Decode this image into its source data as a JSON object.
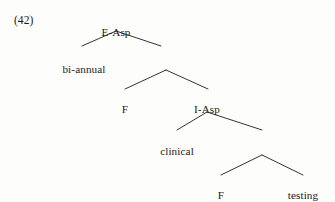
{
  "figure": {
    "example_number": "(42)",
    "type": "syntactic-tree",
    "background_color": "#fdfdfb",
    "line_color": "#1c1c1c",
    "text_color": "#1c1c1c"
  },
  "nodes": [
    {
      "id": "e-asp",
      "label": "E-Asp",
      "x": 116,
      "y": 27,
      "kind": "nonterminal"
    },
    {
      "id": "bi-annual",
      "label": "bi-annual",
      "x": 84,
      "y": 64,
      "kind": "terminal"
    },
    {
      "id": "f1",
      "label": "F",
      "x": 125,
      "y": 104,
      "kind": "nonterminal"
    },
    {
      "id": "i-asp",
      "label": "I-Asp",
      "x": 207,
      "y": 104,
      "kind": "nonterminal"
    },
    {
      "id": "clinical",
      "label": "clinical",
      "x": 177,
      "y": 146,
      "kind": "terminal"
    },
    {
      "id": "f2",
      "label": "F",
      "x": 221,
      "y": 190,
      "kind": "nonterminal"
    },
    {
      "id": "testing",
      "label": "testing",
      "x": 303,
      "y": 190,
      "kind": "terminal"
    }
  ],
  "branches": [
    {
      "id": "branch-easp-left",
      "from": [
        116,
        31
      ],
      "to": [
        82,
        46
      ],
      "parent": "e-asp",
      "child": "bi-annual"
    },
    {
      "id": "branch-easp-right",
      "from": [
        116,
        31
      ],
      "to": [
        161,
        46
      ],
      "parent": "e-asp",
      "child": "fp1"
    },
    {
      "id": "branch-fp1-left",
      "from": [
        166,
        70
      ],
      "to": [
        125,
        89
      ],
      "parent": "fp1",
      "child": "f1"
    },
    {
      "id": "branch-fp1-right",
      "from": [
        166,
        70
      ],
      "to": [
        208,
        89
      ],
      "parent": "fp1",
      "child": "i-asp"
    },
    {
      "id": "branch-iasp-left",
      "from": [
        207,
        112
      ],
      "to": [
        177,
        130
      ],
      "parent": "i-asp",
      "child": "clinical"
    },
    {
      "id": "branch-iasp-right",
      "from": [
        207,
        112
      ],
      "to": [
        262,
        130
      ],
      "parent": "i-asp",
      "child": "fp2"
    },
    {
      "id": "branch-fp2-left",
      "from": [
        262,
        155
      ],
      "to": [
        221,
        175
      ],
      "parent": "fp2",
      "child": "f2"
    },
    {
      "id": "branch-fp2-right",
      "from": [
        262,
        155
      ],
      "to": [
        303,
        175
      ],
      "parent": "fp2",
      "child": "testing"
    }
  ]
}
